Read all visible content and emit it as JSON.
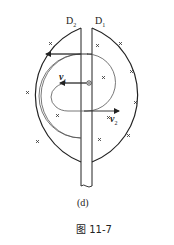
{
  "diagram": {
    "labels": {
      "d2": "D",
      "d2_sub": "2",
      "d1": "D",
      "d1_sub": "1",
      "v1": "v",
      "v1_sub": "1",
      "v2": "v",
      "v2_sub": "2"
    },
    "field_marker": "×",
    "field_markers_count": 12,
    "colors": {
      "stroke": "#222222",
      "path": "#555555",
      "background": "#ffffff"
    }
  },
  "caption": {
    "sub_label": "(d)",
    "figure_label": "图 11-7"
  }
}
